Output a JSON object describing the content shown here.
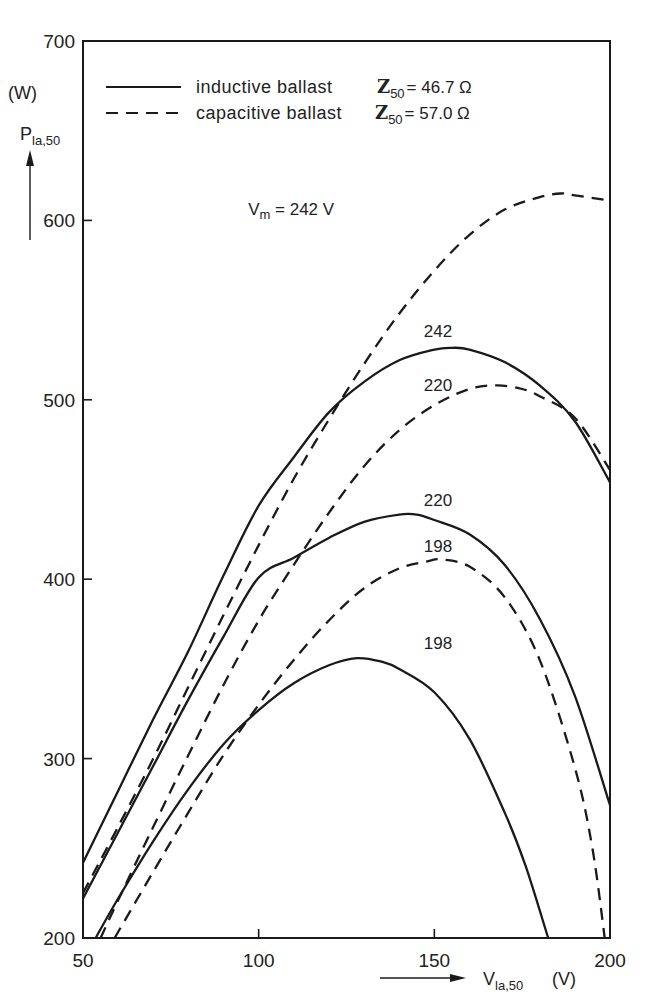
{
  "chart_data": {
    "type": "line",
    "title": "",
    "xlabel": "V_la,50 (V)",
    "xlabel_main": "V",
    "xlabel_sub": "la,50",
    "xlabel_unit": "(V)",
    "ylabel": "P_la,50 (W)",
    "ylabel_main": "P",
    "ylabel_sub": "la,50",
    "ylabel_unit": "(W)",
    "xlim": [
      50,
      200
    ],
    "ylim": [
      200,
      700
    ],
    "xticks": [
      50,
      100,
      150,
      200
    ],
    "yticks": [
      200,
      300,
      400,
      500,
      600,
      700
    ],
    "grid": false,
    "legend_position": "top-left",
    "legend": [
      {
        "label": "inductive ballast",
        "z_symbol": "Z",
        "z_sub": "50",
        "z_value": "= 46.7 Ω",
        "style": "solid"
      },
      {
        "label": "capacitive ballast",
        "z_symbol": "Z",
        "z_sub": "50",
        "z_value": "= 57.0 Ω",
        "style": "dashed"
      }
    ],
    "series": [
      {
        "name": "inductive Vm=242",
        "ballast": "inductive",
        "vm": 242,
        "style": "solid",
        "label": "242",
        "label_at": [
          147,
          535
        ],
        "x": [
          50,
          60,
          70,
          80,
          90,
          100,
          110,
          120,
          130,
          140,
          150,
          155,
          160,
          170,
          180,
          190,
          200
        ],
        "y": [
          242,
          282,
          322,
          360,
          402,
          441,
          468,
          493,
          510,
          522,
          528,
          529,
          528,
          521,
          508,
          488,
          454
        ]
      },
      {
        "name": "inductive Vm=220",
        "ballast": "inductive",
        "vm": 220,
        "style": "solid",
        "label": "220",
        "label_at": [
          147,
          441
        ],
        "x": [
          50,
          60,
          70,
          80,
          90,
          100,
          110,
          120,
          130,
          140,
          145,
          150,
          160,
          170,
          180,
          190,
          200
        ],
        "y": [
          222,
          259,
          296,
          333,
          368,
          401,
          412,
          423,
          432,
          436,
          436,
          433,
          425,
          408,
          378,
          335,
          274
        ]
      },
      {
        "name": "inductive Vm=198",
        "ballast": "inductive",
        "vm": 198,
        "style": "solid",
        "label": "198",
        "label_at": [
          147,
          361
        ],
        "x": [
          53.6,
          60,
          70,
          80,
          90,
          100,
          110,
          120,
          128,
          135,
          140,
          150,
          160,
          170,
          176,
          182.4
        ],
        "y": [
          200,
          222,
          254,
          283,
          308,
          327,
          342,
          352,
          356,
          354,
          350,
          337,
          311,
          270,
          240,
          200
        ]
      },
      {
        "name": "capacitive Vm=242",
        "ballast": "capacitive",
        "vm": 242,
        "style": "dashed",
        "label": "Vm = 242 V",
        "label_at": [
          97,
          603
        ],
        "x": [
          50,
          60,
          70,
          80,
          90,
          100,
          110,
          120,
          130,
          140,
          150,
          160,
          170,
          180,
          186,
          190,
          200
        ],
        "y": [
          225,
          262,
          300,
          340,
          380,
          419,
          456,
          489,
          520,
          548,
          572,
          592,
          606,
          613,
          615,
          614,
          611
        ]
      },
      {
        "name": "capacitive Vm=220",
        "ballast": "capacitive",
        "vm": 220,
        "style": "dashed",
        "label": "220",
        "label_at": [
          147,
          505
        ],
        "x": [
          55,
          60,
          70,
          80,
          90,
          100,
          110,
          120,
          130,
          140,
          150,
          160,
          168,
          175,
          180,
          190,
          200
        ],
        "y": [
          200,
          221,
          262,
          302,
          341,
          377,
          408,
          437,
          463,
          483,
          497,
          506,
          508,
          506,
          502,
          490,
          461
        ]
      },
      {
        "name": "capacitive Vm=198",
        "ballast": "capacitive",
        "vm": 198,
        "style": "dashed",
        "label": "198",
        "label_at": [
          147,
          415
        ],
        "x": [
          59,
          70,
          80,
          90,
          100,
          110,
          120,
          130,
          140,
          148,
          152,
          160,
          170,
          180,
          190,
          195,
          198.5
        ],
        "y": [
          200,
          237,
          270,
          302,
          330,
          355,
          377,
          395,
          406,
          410,
          411,
          407,
          390,
          355,
          295,
          250,
          200
        ]
      }
    ]
  }
}
